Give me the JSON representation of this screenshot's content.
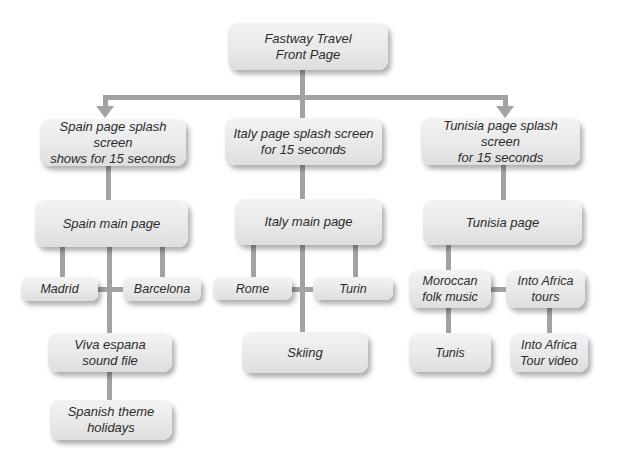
{
  "diagram": {
    "colors": {
      "box_fill": "#e9e9e9",
      "connector": "#a2a2a2",
      "text": "#2b2b2b"
    },
    "nodes": {
      "front_page": "Fastway Travel\nFront Page",
      "spain_splash": "Spain page splash screen\nshows for 15 seconds",
      "italy_splash": "Italy page splash screen\nfor 15 seconds",
      "tunisia_splash": "Tunisia page splash screen\nfor 15 seconds",
      "spain_main": "Spain main page",
      "italy_main": "Italy main page",
      "tunisia_main": "Tunisia page",
      "madrid": "Madrid",
      "barcelona": "Barcelona",
      "viva_espana": "Viva espana\nsound file",
      "spanish_theme": "Spanish theme\nholidays",
      "rome": "Rome",
      "turin": "Turin",
      "skiing": "Skiing",
      "moroccan_folk": "Moroccan\nfolk music",
      "into_africa_tours": "Into Africa\ntours",
      "tunis": "Tunis",
      "into_africa_video": "Into Africa\nTour video"
    },
    "edges": [
      [
        "front_page",
        "spain_splash"
      ],
      [
        "front_page",
        "italy_splash"
      ],
      [
        "front_page",
        "tunisia_splash"
      ],
      [
        "spain_splash",
        "spain_main"
      ],
      [
        "italy_splash",
        "italy_main"
      ],
      [
        "tunisia_splash",
        "tunisia_main"
      ],
      [
        "spain_main",
        "madrid"
      ],
      [
        "spain_main",
        "barcelona"
      ],
      [
        "madrid",
        "barcelona"
      ],
      [
        "spain_main",
        "viva_espana"
      ],
      [
        "viva_espana",
        "spanish_theme"
      ],
      [
        "italy_main",
        "rome"
      ],
      [
        "italy_main",
        "turin"
      ],
      [
        "rome",
        "turin"
      ],
      [
        "italy_main",
        "skiing"
      ],
      [
        "tunisia_main",
        "moroccan_folk"
      ],
      [
        "moroccan_folk",
        "into_africa_tours"
      ],
      [
        "moroccan_folk",
        "tunis"
      ],
      [
        "into_africa_tours",
        "into_africa_video"
      ]
    ]
  }
}
